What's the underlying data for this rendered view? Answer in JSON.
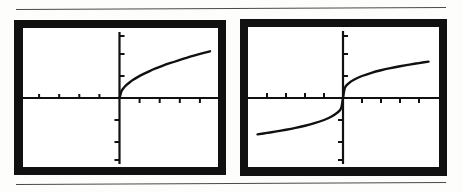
{
  "page": {
    "background": "#fdfdfb",
    "ink": "#111111",
    "rule_color": "#4a4a4a",
    "rules": [
      {
        "name": "top-rule",
        "y": 8
      },
      {
        "name": "bottom-rule",
        "y": 183
      }
    ]
  },
  "figure": {
    "caption": "",
    "screens": [
      {
        "id": "left",
        "label": "square-root-graph",
        "bezel_color": "#111111",
        "screen_color": "#ffffff"
      },
      {
        "id": "right",
        "label": "cube-root-graph",
        "bezel_color": "#111111",
        "screen_color": "#ffffff"
      }
    ]
  },
  "chart_data": [
    {
      "type": "line",
      "id": "left-screen-plot",
      "title": "",
      "subtitle": "",
      "xlabel": "",
      "ylabel": "",
      "function": "y = x^(1/2)",
      "function_label": "square root",
      "xlim": [
        -4.7,
        4.7
      ],
      "ylim": [
        -3.1,
        3.1
      ],
      "grid": false,
      "legend": false,
      "axes": {
        "x_axis_at_y": 0,
        "y_axis_at_x": 0,
        "xticks": [
          -4,
          -3,
          -2,
          -1,
          1,
          2,
          3,
          4
        ],
        "yticks": [
          -3,
          -2,
          -1,
          1,
          2,
          3
        ],
        "xtick_count_left": 4,
        "xtick_count_right": 4,
        "ytick_count_above": 3,
        "ytick_count_below": 3
      },
      "x": [
        0,
        0.1,
        0.2,
        0.35,
        0.5,
        0.7,
        0.9,
        1.2,
        1.5,
        1.8,
        2.1,
        2.5,
        2.9,
        3.3,
        3.7,
        4.1,
        4.5
      ],
      "values": [
        0,
        0.316,
        0.447,
        0.592,
        0.707,
        0.837,
        0.949,
        1.095,
        1.225,
        1.342,
        1.449,
        1.581,
        1.703,
        1.817,
        1.924,
        2.025,
        2.121
      ],
      "domain_note": "defined only for x >= 0; curve drawn in quadrant I"
    },
    {
      "type": "line",
      "id": "right-screen-plot",
      "title": "",
      "subtitle": "",
      "xlabel": "",
      "ylabel": "",
      "function": "y = x^(1/3)",
      "function_label": "cube root",
      "xlim": [
        -4.7,
        4.7
      ],
      "ylim": [
        -3.1,
        3.1
      ],
      "grid": false,
      "legend": false,
      "axes": {
        "x_axis_at_y": 0,
        "y_axis_at_x": 0,
        "xticks": [
          -4,
          -3,
          -2,
          -1,
          1,
          2,
          3,
          4
        ],
        "yticks": [
          -3,
          -2,
          -1,
          1,
          2,
          3
        ],
        "xtick_count_left": 4,
        "xtick_count_right": 4,
        "ytick_count_above": 3,
        "ytick_count_below": 3
      },
      "x": [
        -4.5,
        -4.0,
        -3.5,
        -3.0,
        -2.5,
        -2.0,
        -1.5,
        -1.0,
        -0.6,
        -0.3,
        -0.1,
        0,
        0.1,
        0.3,
        0.6,
        1.0,
        1.5,
        2.0,
        2.5,
        3.0,
        3.5,
        4.0,
        4.5
      ],
      "values": [
        -1.651,
        -1.587,
        -1.518,
        -1.442,
        -1.357,
        -1.26,
        -1.145,
        -1.0,
        -0.843,
        -0.669,
        -0.464,
        0,
        0.464,
        0.669,
        0.843,
        1.0,
        1.145,
        1.26,
        1.357,
        1.442,
        1.518,
        1.587,
        1.651
      ],
      "domain_note": "defined for all real x; odd symmetry through the origin"
    }
  ]
}
